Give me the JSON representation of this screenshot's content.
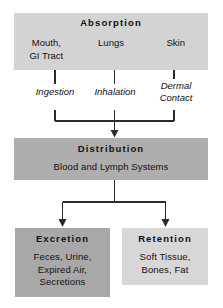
{
  "diagram": {
    "title_semantic": "toxicokinetics-pathway-diagram",
    "colors": {
      "absorption_box": "#d3d3d3",
      "distribution_box": "#aeaeae",
      "excretion_box": "#a8a8a8",
      "retention_box": "#d7d7d7",
      "line": "#2b2b2b",
      "text": "#111111",
      "background": "#ffffff"
    }
  },
  "absorption": {
    "title": "Absorption",
    "columns": [
      {
        "label": "Mouth,\nGI Tract"
      },
      {
        "label": "Lungs"
      },
      {
        "label": "Skin"
      }
    ]
  },
  "routes": [
    {
      "label": "Ingestion"
    },
    {
      "label": "Inhalation"
    },
    {
      "label": "Dermal\nContact"
    }
  ],
  "distribution": {
    "title": "Distribution",
    "body": "Blood and Lymph Systems"
  },
  "outcomes": [
    {
      "title": "Excretion",
      "body": "Feces, Urine,\nExpired Air,\nSecretions"
    },
    {
      "title": "Retention",
      "body": "Soft Tissue,\nBones, Fat"
    }
  ]
}
